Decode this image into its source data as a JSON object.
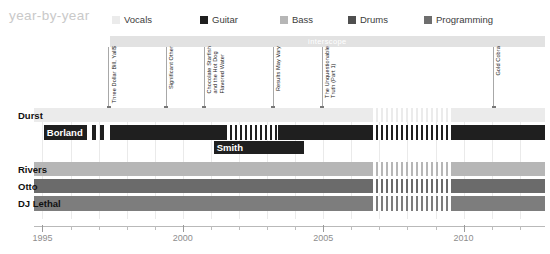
{
  "header": {
    "brand": "year-by-year",
    "legend": [
      {
        "label": "Vocals",
        "color": "#ebebeb"
      },
      {
        "label": "Guitar",
        "color": "#1f1f1f"
      },
      {
        "label": "Bass",
        "color": "#b6b6b6"
      },
      {
        "label": "Drums",
        "color": "#4f4f4f"
      },
      {
        "label": "Programming",
        "color": "#6e6e6e"
      }
    ]
  },
  "label_band": {
    "name": "interscope",
    "start_year": 1997.4,
    "end_year": 2012.9
  },
  "chart_data": {
    "type": "bar",
    "title": "year-by-year",
    "xlabel": "",
    "ylabel": "",
    "xlim": [
      1994.7,
      2012.9
    ],
    "tick_years": [
      1995,
      1996,
      1997,
      1998,
      1999,
      2000,
      2001,
      2002,
      2003,
      2004,
      2005,
      2006,
      2007,
      2008,
      2009,
      2010,
      2011,
      2012
    ],
    "tick_labels": [
      "1995",
      "2000",
      "2005",
      "2010"
    ],
    "labeled_years": [
      1995,
      2000,
      2005,
      2010
    ],
    "grid": true,
    "legend_position": "top",
    "categories": [
      "Durst",
      "Borland",
      "Smith",
      "Rivers",
      "Otto",
      "DJ Lethal"
    ],
    "series": [
      {
        "name": "Durst",
        "role": "Vocals",
        "color": "#ebebeb",
        "row": 0,
        "segments": [
          {
            "start": 1994.7,
            "end": 2006.7,
            "style": "solid"
          },
          {
            "start": 2006.7,
            "end": 2009.6,
            "style": "striped"
          },
          {
            "start": 2009.6,
            "end": 2012.9,
            "style": "solid"
          }
        ]
      },
      {
        "name": "Borland",
        "role": "Guitar",
        "color": "#1f1f1f",
        "row": 1,
        "segments": [
          {
            "start": 1995.05,
            "end": 1996.6,
            "style": "solid"
          },
          {
            "start": 1996.75,
            "end": 1996.9,
            "style": "solid"
          },
          {
            "start": 1997.05,
            "end": 1997.2,
            "style": "solid"
          },
          {
            "start": 1997.4,
            "end": 2001.5,
            "style": "solid"
          },
          {
            "start": 2001.5,
            "end": 2003.4,
            "style": "striped"
          },
          {
            "start": 2003.4,
            "end": 2006.7,
            "style": "solid"
          },
          {
            "start": 2006.7,
            "end": 2009.6,
            "style": "striped"
          },
          {
            "start": 2009.6,
            "end": 2012.9,
            "style": "solid"
          }
        ]
      },
      {
        "name": "Smith",
        "role": "Guitar",
        "color": "#1f1f1f",
        "row": 2,
        "segments": [
          {
            "start": 2001.1,
            "end": 2004.3,
            "style": "solid"
          }
        ]
      },
      {
        "name": "Rivers",
        "role": "Bass",
        "color": "#b6b6b6",
        "row": 3,
        "segments": [
          {
            "start": 1994.7,
            "end": 2006.7,
            "style": "solid"
          },
          {
            "start": 2006.7,
            "end": 2009.6,
            "style": "striped"
          },
          {
            "start": 2009.6,
            "end": 2012.9,
            "style": "solid"
          }
        ]
      },
      {
        "name": "Otto",
        "role": "Drums",
        "color": "#6b6b6b",
        "row": 4,
        "segments": [
          {
            "start": 1994.7,
            "end": 2006.7,
            "style": "solid"
          },
          {
            "start": 2006.7,
            "end": 2009.6,
            "style": "striped"
          },
          {
            "start": 2009.6,
            "end": 2012.9,
            "style": "solid"
          }
        ]
      },
      {
        "name": "DJ Lethal",
        "role": "Programming",
        "color": "#7d7d7d",
        "row": 5,
        "segments": [
          {
            "start": 1994.7,
            "end": 2006.7,
            "style": "solid"
          },
          {
            "start": 2006.7,
            "end": 2009.6,
            "style": "striped"
          },
          {
            "start": 2009.6,
            "end": 2012.9,
            "style": "solid"
          }
        ]
      }
    ],
    "annotations": [
      {
        "label": "Three Dollar Bill, Yall$",
        "year": 1997.35
      },
      {
        "label": "Significant Other",
        "year": 1999.4
      },
      {
        "label": "Chocolate Starfish\nand the Hot Dog\nFlavored Water",
        "year": 2000.75
      },
      {
        "label": "Results May Vary",
        "year": 2003.2
      },
      {
        "label": "The Unquestionable\nTruth (Part 1)",
        "year": 2004.95
      },
      {
        "label": "Gold Cobra",
        "year": 2011.05
      }
    ]
  }
}
